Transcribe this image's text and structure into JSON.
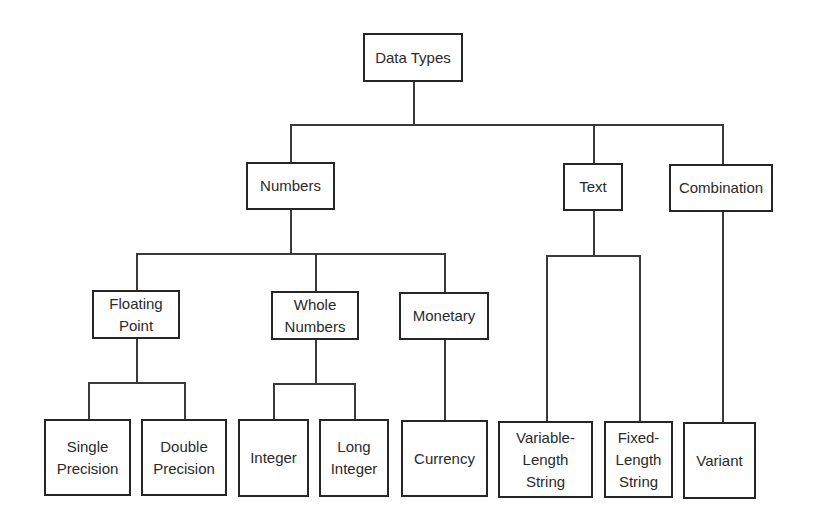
{
  "diagram": {
    "type": "hierarchy-tree",
    "root": "data-types",
    "nodes": [
      {
        "id": "data-types",
        "label": "Data Types",
        "x": 363,
        "y": 33,
        "w": 100,
        "h": 49
      },
      {
        "id": "numbers",
        "label": "Numbers",
        "x": 246,
        "y": 162,
        "w": 89,
        "h": 48
      },
      {
        "id": "text",
        "label": "Text",
        "x": 563,
        "y": 163,
        "w": 60,
        "h": 48
      },
      {
        "id": "combination",
        "label": "Combination",
        "x": 669,
        "y": 164,
        "w": 104,
        "h": 48
      },
      {
        "id": "floating-point",
        "label": "Floating\nPoint",
        "x": 92,
        "y": 290,
        "w": 88,
        "h": 49
      },
      {
        "id": "whole-numbers",
        "label": "Whole\nNumbers",
        "x": 271,
        "y": 291,
        "w": 88,
        "h": 49
      },
      {
        "id": "monetary",
        "label": "Monetary",
        "x": 399,
        "y": 292,
        "w": 90,
        "h": 48
      },
      {
        "id": "single-precision",
        "label": "Single\nPrecision",
        "x": 44,
        "y": 419,
        "w": 87,
        "h": 77
      },
      {
        "id": "double-precision",
        "label": "Double\nPrecision",
        "x": 141,
        "y": 419,
        "w": 86,
        "h": 77
      },
      {
        "id": "integer",
        "label": "Integer",
        "x": 238,
        "y": 419,
        "w": 71,
        "h": 78
      },
      {
        "id": "long-integer",
        "label": "Long\nInteger",
        "x": 319,
        "y": 419,
        "w": 70,
        "h": 78
      },
      {
        "id": "currency",
        "label": "Currency",
        "x": 401,
        "y": 420,
        "w": 87,
        "h": 77
      },
      {
        "id": "variable-length-string",
        "label": "Variable-\nLength\nString",
        "x": 498,
        "y": 421,
        "w": 95,
        "h": 77
      },
      {
        "id": "fixed-length-string",
        "label": "Fixed-\nLength\nString",
        "x": 604,
        "y": 421,
        "w": 69,
        "h": 77
      },
      {
        "id": "variant",
        "label": "Variant",
        "x": 683,
        "y": 422,
        "w": 73,
        "h": 77
      }
    ],
    "edges": [
      {
        "from": "data-types",
        "to": "numbers"
      },
      {
        "from": "data-types",
        "to": "text"
      },
      {
        "from": "data-types",
        "to": "combination"
      },
      {
        "from": "numbers",
        "to": "floating-point"
      },
      {
        "from": "numbers",
        "to": "whole-numbers"
      },
      {
        "from": "numbers",
        "to": "monetary"
      },
      {
        "from": "floating-point",
        "to": "single-precision"
      },
      {
        "from": "floating-point",
        "to": "double-precision"
      },
      {
        "from": "whole-numbers",
        "to": "integer"
      },
      {
        "from": "whole-numbers",
        "to": "long-integer"
      },
      {
        "from": "monetary",
        "to": "currency"
      },
      {
        "from": "text",
        "to": "variable-length-string"
      },
      {
        "from": "text",
        "to": "fixed-length-string"
      },
      {
        "from": "combination",
        "to": "variant"
      }
    ],
    "lines": [
      {
        "dir": "v",
        "x": 413,
        "y": 82,
        "len": 43
      },
      {
        "dir": "h",
        "x": 290,
        "y": 124,
        "len": 433
      },
      {
        "dir": "v",
        "x": 290,
        "y": 124,
        "len": 38
      },
      {
        "dir": "v",
        "x": 593,
        "y": 124,
        "len": 39
      },
      {
        "dir": "v",
        "x": 722,
        "y": 124,
        "len": 40
      },
      {
        "dir": "v",
        "x": 290,
        "y": 210,
        "len": 43
      },
      {
        "dir": "h",
        "x": 136,
        "y": 253,
        "len": 308
      },
      {
        "dir": "v",
        "x": 136,
        "y": 253,
        "len": 37
      },
      {
        "dir": "v",
        "x": 315,
        "y": 253,
        "len": 38
      },
      {
        "dir": "v",
        "x": 444,
        "y": 253,
        "len": 39
      },
      {
        "dir": "v",
        "x": 593,
        "y": 211,
        "len": 44
      },
      {
        "dir": "h",
        "x": 546,
        "y": 255,
        "len": 93
      },
      {
        "dir": "v",
        "x": 546,
        "y": 255,
        "len": 166
      },
      {
        "dir": "v",
        "x": 639,
        "y": 255,
        "len": 166
      },
      {
        "dir": "v",
        "x": 722,
        "y": 212,
        "len": 210
      },
      {
        "dir": "v",
        "x": 136,
        "y": 339,
        "len": 43
      },
      {
        "dir": "h",
        "x": 88,
        "y": 382,
        "len": 96
      },
      {
        "dir": "v",
        "x": 88,
        "y": 382,
        "len": 37
      },
      {
        "dir": "v",
        "x": 184,
        "y": 382,
        "len": 37
      },
      {
        "dir": "v",
        "x": 315,
        "y": 340,
        "len": 43
      },
      {
        "dir": "h",
        "x": 273,
        "y": 383,
        "len": 81
      },
      {
        "dir": "v",
        "x": 273,
        "y": 383,
        "len": 36
      },
      {
        "dir": "v",
        "x": 354,
        "y": 383,
        "len": 36
      },
      {
        "dir": "v",
        "x": 444,
        "y": 340,
        "len": 80
      }
    ]
  }
}
